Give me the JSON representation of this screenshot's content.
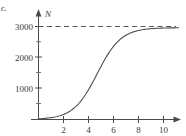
{
  "figure": {
    "part_label": "c.",
    "top_artifact_text": "",
    "axis_y_name": "N",
    "axis_x_name": ""
  },
  "chart_data": {
    "type": "line",
    "title": "",
    "subtitle": "",
    "xlabel": "",
    "ylabel": "N",
    "xlim": [
      0,
      11.2
    ],
    "ylim": [
      0,
      3250
    ],
    "grid": false,
    "legend": "none",
    "x_ticks_major": [
      2,
      4,
      6,
      8,
      10
    ],
    "x_tick_labels": [
      "2",
      "4",
      "6",
      "8",
      "10"
    ],
    "x_ticks_minor": [
      1,
      3,
      5,
      7,
      9,
      11
    ],
    "y_ticks_major": [
      1000,
      2000,
      3000
    ],
    "y_tick_labels": [
      "1000",
      "2000",
      "3000"
    ],
    "y_ticks_minor": [
      500,
      1500,
      2500
    ],
    "asymptote": {
      "value": 3000,
      "label": "",
      "style": "dashed",
      "color": "#555555"
    },
    "series": [
      {
        "name": "N(t)",
        "type": "logistic",
        "color": "#4d4d4d",
        "carrying_capacity": 3000,
        "inflection_x": 4.7,
        "growth_rate": 1.05,
        "x": [
          0,
          0.5,
          1,
          1.5,
          2,
          2.5,
          3,
          3.5,
          4,
          4.5,
          5,
          5.5,
          6,
          6.5,
          7,
          7.5,
          8,
          8.5,
          9,
          9.5,
          10,
          10.5,
          11
        ],
        "values": [
          20,
          35,
          58,
          97,
          160,
          260,
          415,
          640,
          945,
          1310,
          1690,
          2050,
          2350,
          2575,
          2730,
          2835,
          2900,
          2940,
          2963,
          2978,
          2987,
          2992,
          2995
        ]
      }
    ]
  }
}
